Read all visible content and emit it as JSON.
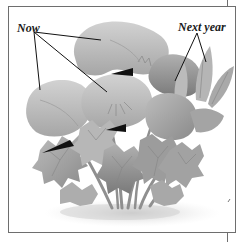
{
  "labels": {
    "now": "Now",
    "next_year": "Next year"
  },
  "colors": {
    "frame": "#6e6e6e",
    "ink": "#111111",
    "leaf_light": "#c9c9c9",
    "leaf_mid": "#a8a8a8",
    "leaf_dark": "#7d7d7d",
    "ground_shadow": "#d4d4d4",
    "background": "#ffffff"
  }
}
